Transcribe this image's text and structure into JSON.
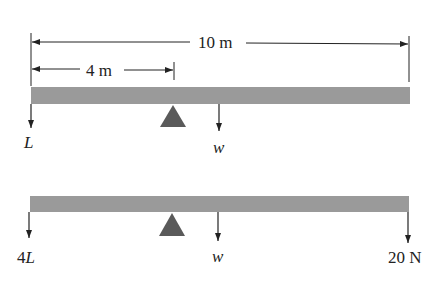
{
  "colors": {
    "beam": "#9a9a9a",
    "fulcrum": "#5a5a5a",
    "line": "#222222",
    "background": "#ffffff"
  },
  "dimensions": {
    "total_length": "10 m",
    "fulcrum_distance": "4 m"
  },
  "diagram_top": {
    "left_force": "L",
    "weight": "w"
  },
  "diagram_bottom": {
    "left_force": "4",
    "left_force_var": "L",
    "weight": "w",
    "right_force": "20 N"
  }
}
